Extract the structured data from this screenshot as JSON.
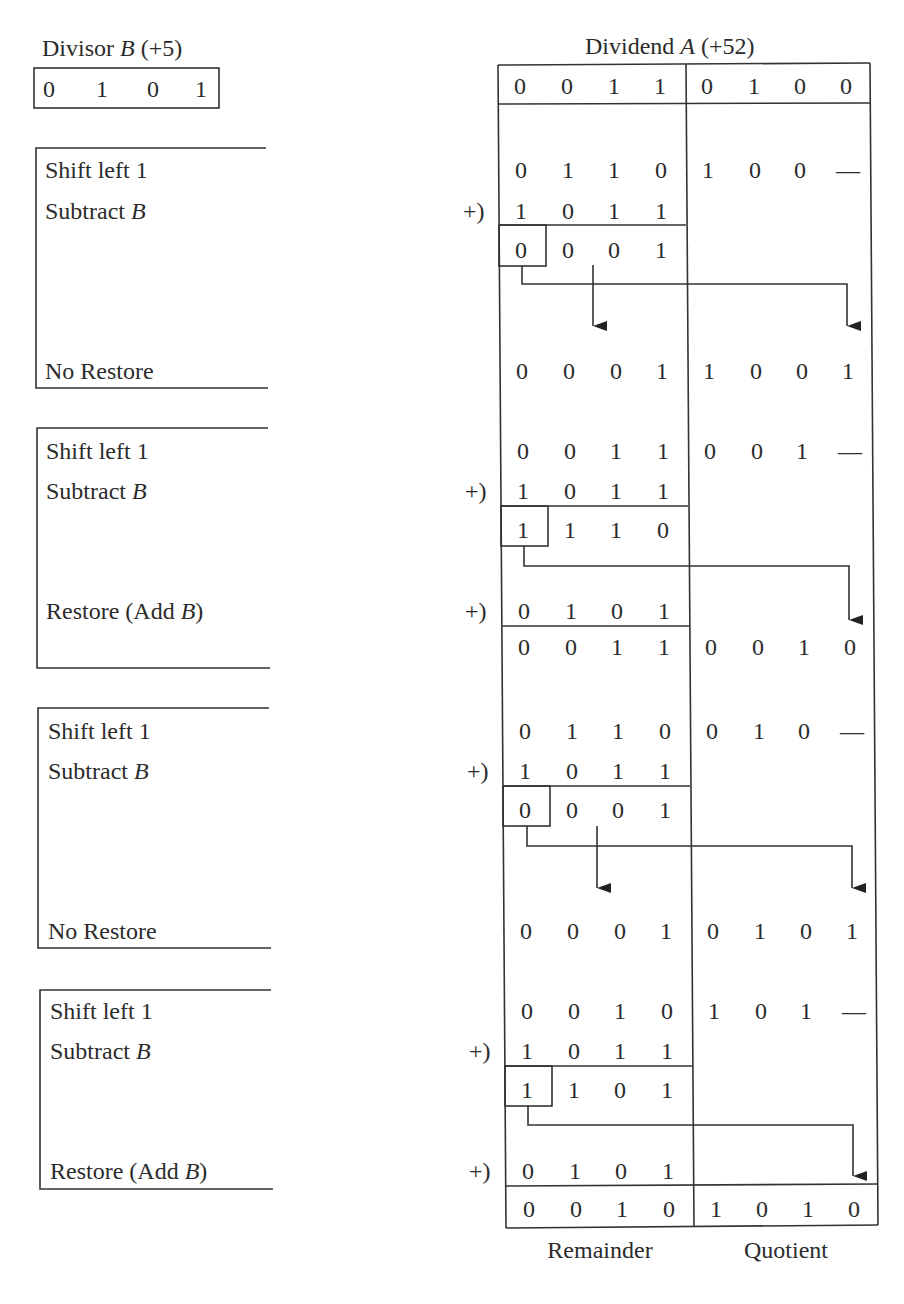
{
  "divisor": {
    "title_prefix": "Divisor ",
    "title_var": "B",
    "title_suffix": " (+5)",
    "bits": [
      "0",
      "1",
      "0",
      "1"
    ]
  },
  "dividend": {
    "title_prefix": "Dividend ",
    "title_var": "A",
    "title_suffix": " (+52)",
    "bits": [
      "0",
      "0",
      "1",
      "1",
      "0",
      "1",
      "0",
      "0"
    ]
  },
  "plus_marker": "+)",
  "dash": "—",
  "steps": [
    {
      "label_shift": "Shift left 1",
      "label_subtract_prefix": "Subtract ",
      "label_subtract_var": "B",
      "label_result": "No Restore",
      "result_var": "",
      "result_suffix": "",
      "shifted": [
        "0",
        "1",
        "1",
        "0",
        "1",
        "0",
        "0",
        "—"
      ],
      "subtrahend": [
        "1",
        "0",
        "1",
        "1"
      ],
      "difference": [
        "0",
        "0",
        "0",
        "1"
      ],
      "restore_addend": [],
      "final": [
        "0",
        "0",
        "0",
        "1",
        "1",
        "0",
        "0",
        "1"
      ],
      "restored": false
    },
    {
      "label_shift": "Shift left 1",
      "label_subtract_prefix": "Subtract ",
      "label_subtract_var": "B",
      "label_result": "Restore (Add ",
      "result_var": "B",
      "result_suffix": ")",
      "shifted": [
        "0",
        "0",
        "1",
        "1",
        "0",
        "0",
        "1",
        "—"
      ],
      "subtrahend": [
        "1",
        "0",
        "1",
        "1"
      ],
      "difference": [
        "1",
        "1",
        "1",
        "0"
      ],
      "restore_addend": [
        "0",
        "1",
        "0",
        "1"
      ],
      "final": [
        "0",
        "0",
        "1",
        "1",
        "0",
        "0",
        "1",
        "0"
      ],
      "restored": true
    },
    {
      "label_shift": "Shift left 1",
      "label_subtract_prefix": "Subtract ",
      "label_subtract_var": "B",
      "label_result": "No Restore",
      "result_var": "",
      "result_suffix": "",
      "shifted": [
        "0",
        "1",
        "1",
        "0",
        "0",
        "1",
        "0",
        "—"
      ],
      "subtrahend": [
        "1",
        "0",
        "1",
        "1"
      ],
      "difference": [
        "0",
        "0",
        "0",
        "1"
      ],
      "restore_addend": [],
      "final": [
        "0",
        "0",
        "0",
        "1",
        "0",
        "1",
        "0",
        "1"
      ],
      "restored": false
    },
    {
      "label_shift": "Shift left 1",
      "label_subtract_prefix": "Subtract ",
      "label_subtract_var": "B",
      "label_result": "Restore (Add ",
      "result_var": "B",
      "result_suffix": ")",
      "shifted": [
        "0",
        "0",
        "1",
        "0",
        "1",
        "0",
        "1",
        "—"
      ],
      "subtrahend": [
        "1",
        "0",
        "1",
        "1"
      ],
      "difference": [
        "1",
        "1",
        "0",
        "1"
      ],
      "restore_addend": [
        "0",
        "1",
        "0",
        "1"
      ],
      "final": [
        "0",
        "0",
        "1",
        "0",
        "1",
        "0",
        "1",
        "0"
      ],
      "restored": true
    }
  ],
  "footer": {
    "remainder_label": "Remainder",
    "quotient_label": "Quotient"
  }
}
